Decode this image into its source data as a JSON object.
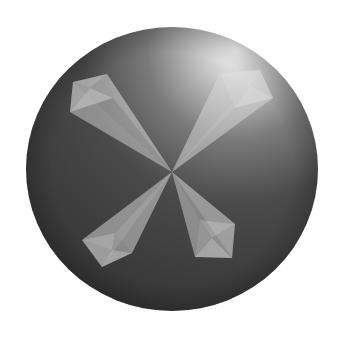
{
  "image": {
    "description": "3D rendered dark sphere with four translucent pyramidal petals radiating from its center in an X pattern",
    "background": "#ffffff",
    "sphere": {
      "cx": 172,
      "cy": 169,
      "rx": 146,
      "ry": 142,
      "color_dark": "#2e2e2e",
      "color_mid": "#4a4a4a",
      "highlight": "#f4f4f4"
    },
    "center": [
      172,
      172
    ],
    "petal_color": "#b8b8b8",
    "petals": [
      {
        "name": "upper-left",
        "base": [
          [
            73,
            82
          ],
          [
            107,
            74
          ],
          [
            113,
            98
          ],
          [
            70,
            112
          ]
        ],
        "inner": [
          90,
          88
        ]
      },
      {
        "name": "upper-right",
        "base": [
          [
            220,
            73
          ],
          [
            260,
            70
          ],
          [
            273,
            98
          ],
          [
            235,
            108
          ]
        ],
        "inner": [
          250,
          86
        ]
      },
      {
        "name": "lower-left",
        "base": [
          [
            82,
            240
          ],
          [
            115,
            233
          ],
          [
            132,
            253
          ],
          [
            102,
            267
          ]
        ],
        "inner": [
          112,
          250
        ]
      },
      {
        "name": "lower-right",
        "base": [
          [
            200,
            220
          ],
          [
            235,
            224
          ],
          [
            232,
            258
          ],
          [
            195,
            257
          ]
        ],
        "inner": [
          212,
          238
        ]
      }
    ]
  }
}
